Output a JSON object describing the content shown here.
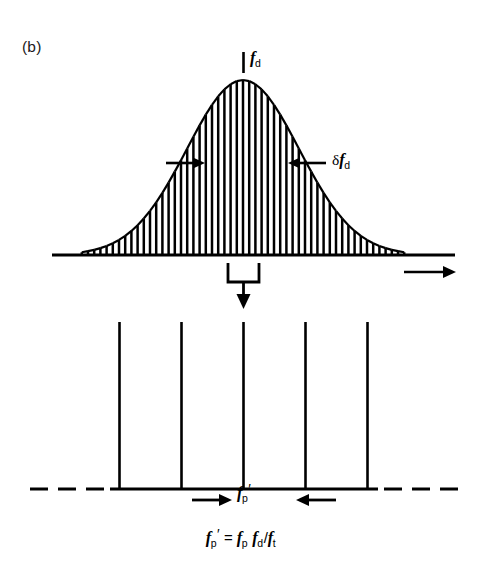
{
  "figure": {
    "panel_label": "(b)",
    "background_color": "#ffffff",
    "ink_color": "#000000"
  },
  "labels": {
    "peak_frequency": {
      "symbol": "f",
      "subscript": "d",
      "prime": "",
      "display": "f_d"
    },
    "linewidth": {
      "delta": "δ",
      "symbol": "f",
      "subscript": "d",
      "display": "δf_d"
    },
    "pulse_spacing": {
      "symbol": "f",
      "subscript": "p",
      "prime": "′",
      "display": "f_p′"
    },
    "equation": {
      "lhs_symbol": "f",
      "lhs_subscript": "p",
      "lhs_prime": "′",
      "equals": "=",
      "t1_symbol": "f",
      "t1_subscript": "p",
      "t2_symbol": "f",
      "t2_subscript": "d",
      "divide": "/",
      "t3_symbol": "f",
      "t3_subscript": "t",
      "display": "f_p′ = f_p f_d/f_t"
    }
  },
  "chart_data": {
    "type": "area",
    "xlabel": "",
    "ylabel": "",
    "grid": false,
    "legend": null,
    "panels": [
      {
        "name": "upper-spectrum",
        "description": "Gaussian (Doppler-broadened) envelope rendered as a dense comb of vertical spectral lines standing on a horizontal frequency axis.",
        "axis": {
          "x_start": 52,
          "x_end": 455,
          "y_baseline": 255,
          "arrow_direction": "right"
        },
        "peak": {
          "x": 243,
          "y_top": 80,
          "height": 175
        },
        "gaussian_sigma_px": 56,
        "n_comb_lines": 53,
        "comb_spacing_px": 6.2,
        "annotations": [
          {
            "name": "peak-marker",
            "type": "tick",
            "x": 243,
            "y_top": 52,
            "y_bottom": 72,
            "label": "f_d"
          },
          {
            "name": "linewidth-left-arrow",
            "type": "arrow",
            "x_tail": 166,
            "x_head": 203,
            "y": 163,
            "direction": "right"
          },
          {
            "name": "linewidth-right-arrow",
            "type": "arrow",
            "x_tail": 326,
            "x_head": 290,
            "y": 163,
            "direction": "left"
          },
          {
            "name": "linewidth-label",
            "type": "text",
            "x": 332,
            "y": 157,
            "label": "δf_d"
          },
          {
            "name": "axis-arrow",
            "type": "arrow",
            "x_tail": 404,
            "x_head": 455,
            "y": 272,
            "direction": "right"
          }
        ]
      },
      {
        "name": "connector",
        "description": "Bracket funnel with downward arrow mapping the spectrum onto the mode comb below.",
        "bracket": {
          "x_left": 228,
          "x_right": 259,
          "y_top": 263,
          "y_bottom": 283
        },
        "arrow": {
          "x": 243.5,
          "y_tail": 283,
          "y_head": 307,
          "direction": "down"
        }
      },
      {
        "name": "lower-mode-comb",
        "description": "Five equally spaced vertical comb lines of equal height on a solid axis that continues as dashes at both ends.",
        "axis": {
          "x_solid_start": 110,
          "x_solid_end": 378,
          "y_baseline": 489
        },
        "dashes_left": [
          [
            30,
            48
          ],
          [
            58,
            76
          ],
          [
            86,
            104
          ]
        ],
        "dashes_right": [
          [
            384,
            402
          ],
          [
            412,
            430
          ],
          [
            440,
            458
          ]
        ],
        "line_x_positions": [
          119,
          181,
          243,
          305,
          367
        ],
        "line_y_top": 322,
        "line_height": 167,
        "line_spacing_px": 62,
        "annotations": [
          {
            "name": "spacing-left-arrow",
            "type": "arrow",
            "x_tail": 192,
            "x_head": 231,
            "y": 500,
            "direction": "right"
          },
          {
            "name": "spacing-right-arrow",
            "type": "arrow",
            "x_tail": 336,
            "x_head": 297,
            "y": 500,
            "direction": "left"
          },
          {
            "name": "spacing-label",
            "type": "text",
            "x": 243,
            "y": 494,
            "label": "f_p′"
          }
        ]
      }
    ]
  }
}
